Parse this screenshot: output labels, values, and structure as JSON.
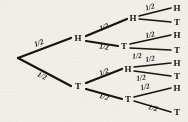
{
  "diagram": {
    "type": "probability-tree",
    "stroke_color": "#151310",
    "background_color": "#f3f1ec",
    "root": {
      "id": "root",
      "label": "",
      "x": 13,
      "y": 58
    },
    "nodes": [
      {
        "id": "n-h",
        "label": "H",
        "x": 78,
        "y": 38,
        "level": 1
      },
      {
        "id": "n-t",
        "label": "T",
        "x": 78,
        "y": 86,
        "level": 1
      },
      {
        "id": "n-hh",
        "label": "H",
        "x": 133,
        "y": 18,
        "level": 2
      },
      {
        "id": "n-ht",
        "label": "T",
        "x": 124,
        "y": 46,
        "level": 2
      },
      {
        "id": "n-th",
        "label": "H",
        "x": 128,
        "y": 69,
        "level": 2
      },
      {
        "id": "n-tt",
        "label": "T",
        "x": 128,
        "y": 99,
        "level": 2
      },
      {
        "id": "n-hhh",
        "label": "H",
        "x": 177,
        "y": 8,
        "level": 3
      },
      {
        "id": "n-hht",
        "label": "T",
        "x": 177,
        "y": 22,
        "level": 3
      },
      {
        "id": "n-hth",
        "label": "H",
        "x": 177,
        "y": 35,
        "level": 3
      },
      {
        "id": "n-htt",
        "label": "T",
        "x": 177,
        "y": 50,
        "level": 3
      },
      {
        "id": "n-thh",
        "label": "H",
        "x": 177,
        "y": 63,
        "level": 3
      },
      {
        "id": "n-tht",
        "label": "T",
        "x": 177,
        "y": 76,
        "level": 3
      },
      {
        "id": "n-tth",
        "label": "H",
        "x": 177,
        "y": 88,
        "level": 3
      },
      {
        "id": "n-ttt",
        "label": "T",
        "x": 177,
        "y": 112,
        "level": 3
      }
    ],
    "edges": [
      {
        "id": "e-root-h",
        "from": "root",
        "to": "n-h",
        "x1": 18,
        "y1": 58,
        "x2": 71,
        "y2": 38,
        "width": 2.2
      },
      {
        "id": "e-root-t",
        "from": "root",
        "to": "n-t",
        "x1": 18,
        "y1": 58,
        "x2": 71,
        "y2": 86,
        "width": 2.2
      },
      {
        "id": "e-h-hh",
        "from": "n-h",
        "to": "n-hh",
        "x1": 86,
        "y1": 36,
        "x2": 127,
        "y2": 19,
        "width": 2.2
      },
      {
        "id": "e-h-ht",
        "from": "n-h",
        "to": "n-ht",
        "x1": 86,
        "y1": 41,
        "x2": 118,
        "y2": 46,
        "width": 2.2
      },
      {
        "id": "e-t-th",
        "from": "n-t",
        "to": "n-th",
        "x1": 86,
        "y1": 83,
        "x2": 122,
        "y2": 69,
        "width": 2.2
      },
      {
        "id": "e-t-tt",
        "from": "n-t",
        "to": "n-tt",
        "x1": 86,
        "y1": 89,
        "x2": 122,
        "y2": 99,
        "width": 2.2
      },
      {
        "id": "e-hh-hhh",
        "from": "n-hh",
        "to": "n-hhh",
        "x1": 139,
        "y1": 16,
        "x2": 171,
        "y2": 8,
        "width": 1.5
      },
      {
        "id": "e-hh-hht",
        "from": "n-hh",
        "to": "n-hht",
        "x1": 139,
        "y1": 19,
        "x2": 171,
        "y2": 22,
        "width": 1.5
      },
      {
        "id": "e-ht-hth",
        "from": "n-ht",
        "to": "n-hth",
        "x1": 130,
        "y1": 44,
        "x2": 171,
        "y2": 35,
        "width": 1.5
      },
      {
        "id": "e-ht-htt",
        "from": "n-ht",
        "to": "n-htt",
        "x1": 130,
        "y1": 48,
        "x2": 171,
        "y2": 50,
        "width": 1.5
      },
      {
        "id": "e-th-thh",
        "from": "n-th",
        "to": "n-thh",
        "x1": 134,
        "y1": 67,
        "x2": 171,
        "y2": 63,
        "width": 1.5
      },
      {
        "id": "e-th-tht",
        "from": "n-th",
        "to": "n-tht",
        "x1": 134,
        "y1": 71,
        "x2": 171,
        "y2": 76,
        "width": 1.5
      },
      {
        "id": "e-tt-tth",
        "from": "n-tt",
        "to": "n-tth",
        "x1": 134,
        "y1": 97,
        "x2": 171,
        "y2": 88,
        "width": 1.5
      },
      {
        "id": "e-tt-ttt",
        "from": "n-tt",
        "to": "n-ttt",
        "x1": 134,
        "y1": 101,
        "x2": 171,
        "y2": 112,
        "width": 1.5
      }
    ],
    "edge_labels": [
      {
        "id": "lbl-root-h",
        "text": "1/2",
        "x": 39,
        "y": 43,
        "rotate": -21
      },
      {
        "id": "lbl-root-t",
        "text": "1/2",
        "x": 42,
        "y": 76,
        "rotate": 25
      },
      {
        "id": "lbl-h-hh",
        "text": "1/2",
        "x": 104,
        "y": 27,
        "rotate": -22
      },
      {
        "id": "lbl-h-ht",
        "text": "1/2",
        "x": 104,
        "y": 47,
        "rotate": 8
      },
      {
        "id": "lbl-t-th",
        "text": "1/2",
        "x": 104,
        "y": 72,
        "rotate": -20
      },
      {
        "id": "lbl-t-tt",
        "text": "1/2",
        "x": 104,
        "y": 97,
        "rotate": 16
      },
      {
        "id": "lbl-hh-hhh",
        "text": "1/2",
        "x": 150,
        "y": 7,
        "rotate": -16
      },
      {
        "id": "lbl-ht-hth",
        "text": "1/2",
        "x": 150,
        "y": 35,
        "rotate": -14
      },
      {
        "id": "lbl-ht-htt",
        "text": "1/2",
        "x": 137,
        "y": 56,
        "rotate": -6
      },
      {
        "id": "lbl-th-thh",
        "text": "1/2",
        "x": 150,
        "y": 59,
        "rotate": -10
      },
      {
        "id": "lbl-th-tht",
        "text": "1/2",
        "x": 141,
        "y": 78,
        "rotate": -10
      },
      {
        "id": "lbl-tt-tth",
        "text": "1/2",
        "x": 145,
        "y": 87,
        "rotate": -14
      },
      {
        "id": "lbl-tt-ttt",
        "text": "1/2",
        "x": 153,
        "y": 108,
        "rotate": 14
      }
    ]
  }
}
